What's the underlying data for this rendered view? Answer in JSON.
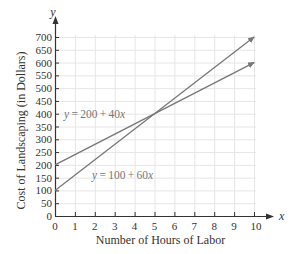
{
  "chart_data": {
    "type": "line",
    "title": "",
    "xlabel": "Number of Hours of Labor",
    "ylabel": "Cost of Landscaping (in Dollars)",
    "x_axis_var": "x",
    "y_axis_var": "y",
    "xlim": [
      0,
      10
    ],
    "ylim": [
      0,
      700
    ],
    "x_ticks": [
      0,
      1,
      2,
      3,
      4,
      5,
      6,
      7,
      8,
      9,
      10
    ],
    "y_ticks": [
      0,
      50,
      100,
      150,
      200,
      250,
      300,
      350,
      400,
      450,
      500,
      550,
      600,
      650,
      700
    ],
    "grid": true,
    "legend": "none",
    "series": [
      {
        "name": "y = 200 + 40x",
        "label": "y = 200 + 40x",
        "x": [
          0,
          10
        ],
        "y": [
          200,
          600
        ],
        "color": "#777777"
      },
      {
        "name": "y = 100 + 60x",
        "label": "y = 100 + 60x",
        "x": [
          0,
          10
        ],
        "y": [
          100,
          700
        ],
        "color": "#777777"
      }
    ],
    "annotations": [
      {
        "text": "y = 200 + 40x",
        "x": 0.5,
        "y": 400
      },
      {
        "text": "y = 100 + 60x",
        "x": 2,
        "y": 160
      }
    ],
    "intersection": {
      "x": 5,
      "y": 400
    }
  },
  "colors": {
    "axis": "#333333",
    "grid": "#e6e6e6",
    "lines": "#777777"
  }
}
